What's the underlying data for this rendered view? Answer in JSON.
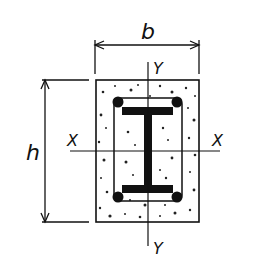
{
  "diagram": {
    "type": "cross-section",
    "labels": {
      "width": "b",
      "height": "h",
      "axis_x_left": "X",
      "axis_x_right": "X",
      "axis_y_top": "Y",
      "axis_y_bottom": "Y"
    },
    "colors": {
      "line": "#111111",
      "background": "#ffffff"
    }
  }
}
